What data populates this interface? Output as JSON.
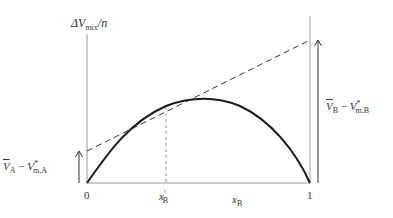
{
  "diagram": {
    "y_axis_label": {
      "symbol": "ΔV",
      "subscript": "mix",
      "suffix": "/n"
    },
    "x_axis_label": {
      "symbol": "x",
      "subscript": "B"
    },
    "ticks": {
      "left": "0",
      "right": "1",
      "marked": {
        "symbol": "x",
        "prime": "′",
        "subscript": "B"
      }
    },
    "left_intercept_label": {
      "bar": "V",
      "bar_sub": "A",
      "minus": " − ",
      "symbol": "V",
      "sup": "*",
      "sub": "m,A"
    },
    "right_intercept_label": {
      "bar": "V",
      "bar_sub": "B",
      "minus": " − ",
      "symbol": "V",
      "sup": "*",
      "sub": "m,B"
    },
    "colors": {
      "curve": "#1a1a1a",
      "axes": "#888888",
      "dashed": "#333333",
      "arrows": "#333333"
    }
  }
}
